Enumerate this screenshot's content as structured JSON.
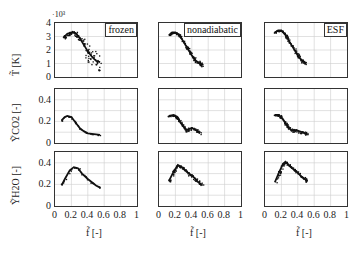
{
  "chart_data": {
    "type": "scatter",
    "layout": "3x3 grid",
    "columns": [
      "frozen",
      "nonadiabatic",
      "ESF"
    ],
    "rows": [
      {
        "ylabel": "T̃ [K]",
        "yscale_note": "·10³",
        "ylim": [
          0,
          4
        ],
        "yticks": [
          "0",
          "1",
          "2",
          "3",
          "4"
        ]
      },
      {
        "ylabel": "ỸCO2 [-]",
        "ylim": [
          0,
          0.5
        ],
        "yticks": [
          "0",
          "0.2",
          "0.4"
        ]
      },
      {
        "ylabel": "ỸH2O [-]",
        "ylim": [
          0,
          0.5
        ],
        "yticks": [
          "0",
          "0.2",
          "0.4"
        ]
      }
    ],
    "xlabel": "f̃ [-]",
    "xlim": [
      0,
      1
    ],
    "xticks": [
      "0",
      "0.2",
      "0.4",
      "0.6",
      "0.8",
      "1"
    ],
    "grid": true,
    "series": {
      "frozen": {
        "T": [
          [
            0.1,
            2.9
          ],
          [
            0.15,
            3.2
          ],
          [
            0.2,
            3.3
          ],
          [
            0.25,
            3.25
          ],
          [
            0.3,
            2.9
          ],
          [
            0.35,
            2.4
          ],
          [
            0.4,
            1.9
          ],
          [
            0.45,
            1.5
          ],
          [
            0.5,
            1.2
          ],
          [
            0.55,
            1.1
          ]
        ],
        "YCO2": [
          [
            0.08,
            0.21
          ],
          [
            0.12,
            0.24
          ],
          [
            0.15,
            0.25
          ],
          [
            0.2,
            0.24
          ],
          [
            0.25,
            0.19
          ],
          [
            0.3,
            0.14
          ],
          [
            0.35,
            0.11
          ],
          [
            0.4,
            0.09
          ],
          [
            0.5,
            0.08
          ],
          [
            0.55,
            0.075
          ]
        ],
        "YH2O": [
          [
            0.08,
            0.19
          ],
          [
            0.12,
            0.25
          ],
          [
            0.18,
            0.33
          ],
          [
            0.23,
            0.36
          ],
          [
            0.28,
            0.35
          ],
          [
            0.33,
            0.3
          ],
          [
            0.4,
            0.25
          ],
          [
            0.45,
            0.22
          ],
          [
            0.5,
            0.19
          ],
          [
            0.55,
            0.17
          ]
        ]
      },
      "nonadiabatic": {
        "T": [
          [
            0.12,
            3.1
          ],
          [
            0.16,
            3.3
          ],
          [
            0.2,
            3.3
          ],
          [
            0.25,
            3.1
          ],
          [
            0.3,
            2.6
          ],
          [
            0.35,
            2.1
          ],
          [
            0.4,
            1.6
          ],
          [
            0.45,
            1.2
          ],
          [
            0.5,
            1.0
          ],
          [
            0.52,
            0.9
          ]
        ],
        "YCO2": [
          [
            0.12,
            0.25
          ],
          [
            0.18,
            0.26
          ],
          [
            0.23,
            0.23
          ],
          [
            0.28,
            0.17
          ],
          [
            0.33,
            0.12
          ],
          [
            0.4,
            0.14
          ],
          [
            0.45,
            0.12
          ],
          [
            0.5,
            0.09
          ]
        ],
        "YH2O": [
          [
            0.12,
            0.23
          ],
          [
            0.18,
            0.32
          ],
          [
            0.23,
            0.38
          ],
          [
            0.28,
            0.36
          ],
          [
            0.35,
            0.31
          ],
          [
            0.42,
            0.27
          ],
          [
            0.48,
            0.22
          ],
          [
            0.52,
            0.2
          ]
        ]
      },
      "ESF": {
        "T": [
          [
            0.12,
            3.3
          ],
          [
            0.16,
            3.45
          ],
          [
            0.2,
            3.45
          ],
          [
            0.25,
            3.1
          ],
          [
            0.3,
            2.6
          ],
          [
            0.35,
            2.1
          ],
          [
            0.4,
            1.6
          ],
          [
            0.45,
            1.2
          ],
          [
            0.5,
            1.0
          ]
        ],
        "YCO2": [
          [
            0.12,
            0.26
          ],
          [
            0.17,
            0.26
          ],
          [
            0.22,
            0.22
          ],
          [
            0.27,
            0.16
          ],
          [
            0.32,
            0.12
          ],
          [
            0.38,
            0.12
          ],
          [
            0.45,
            0.1
          ],
          [
            0.52,
            0.08
          ]
        ],
        "YH2O": [
          [
            0.12,
            0.22
          ],
          [
            0.17,
            0.31
          ],
          [
            0.22,
            0.39
          ],
          [
            0.25,
            0.41
          ],
          [
            0.3,
            0.37
          ],
          [
            0.38,
            0.32
          ],
          [
            0.45,
            0.27
          ],
          [
            0.52,
            0.23
          ]
        ]
      }
    }
  }
}
